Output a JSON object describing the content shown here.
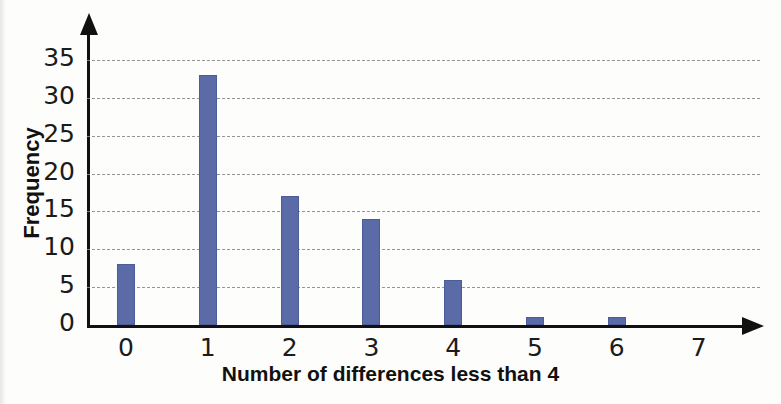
{
  "chart_data": {
    "type": "bar",
    "title": "",
    "subtitle": "",
    "xlabel": "Number of differences less than 4",
    "ylabel": "Frequency",
    "categories": [
      "0",
      "1",
      "2",
      "3",
      "4",
      "5",
      "6",
      "7"
    ],
    "values": [
      8,
      33,
      17,
      14,
      6,
      1,
      1,
      0
    ],
    "series": [
      {
        "name": "Frequency",
        "values": [
          8,
          33,
          17,
          14,
          6,
          1,
          1,
          0
        ]
      }
    ],
    "ylim": [
      0,
      35
    ],
    "ytick_labels": [
      "0",
      "5",
      "10",
      "15",
      "20",
      "25",
      "30",
      "35"
    ],
    "ytick_values": [
      0,
      5,
      10,
      15,
      20,
      25,
      30,
      35
    ],
    "xtick_labels": [
      "0",
      "1",
      "2",
      "3",
      "4",
      "5",
      "6",
      "7"
    ],
    "grid": "horizontal-dashed",
    "legend": "none",
    "bar_color": "#5b6ba8",
    "gridline_color": "#8a8a8a",
    "axis_color": "#111111",
    "background_color": "#fdfdfb",
    "annotations": []
  },
  "axes": {
    "y_arrow": "up-arrow-icon",
    "x_arrow": "right-arrow-icon"
  }
}
